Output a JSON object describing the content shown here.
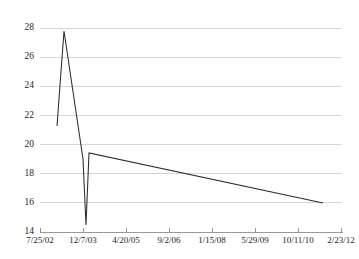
{
  "chart_data": {
    "type": "line",
    "title": "",
    "subtitle": "",
    "xlabel": "",
    "ylabel": "",
    "grid": "horizontal",
    "legend": "none",
    "ylim": [
      14,
      28
    ],
    "yticks": [
      14,
      16,
      18,
      20,
      22,
      24,
      26,
      28
    ],
    "ytick_labels": [
      "14",
      "16",
      "18",
      "20",
      "22",
      "24",
      "26",
      "28"
    ],
    "xtick_labels": [
      "7/25/02",
      "12/7/03",
      "4/20/05",
      "9/2/06",
      "1/15/08",
      "5/29/09",
      "10/11/10",
      "2/23/12"
    ],
    "xlim_labels": [
      "7/25/02",
      "2/23/12"
    ],
    "series": [
      {
        "name": "series-1",
        "color": "#2b2b2b",
        "x": [
          "2003-02-10",
          "2003-10-05",
          "2004-03-20",
          "2004-04-25",
          "2004-06-20",
          "2012-01-10"
        ],
        "values": [
          20.9,
          27.1,
          19.3,
          15.0,
          19.0,
          15.9
        ],
        "x_positions": [
          57,
          64,
          83,
          86,
          89,
          323
        ],
        "y_positions": [
          126,
          31,
          159,
          225,
          153,
          203
        ]
      }
    ],
    "annotations": []
  },
  "axes": {
    "plot_left": 40,
    "plot_right": 341,
    "plot_top": 28,
    "plot_bottom": 232,
    "gridline_color": "#d2d2d2",
    "axis_color": "#8e8e8e",
    "background": "#ffffff"
  }
}
